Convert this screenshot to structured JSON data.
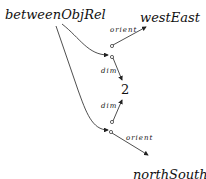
{
  "diagram": {
    "nodes": {
      "source": "betweenObjRel",
      "target_top": "westEast",
      "target_mid": "2",
      "target_bottom": "northSouth"
    },
    "edge_labels": {
      "top_orient": "orient",
      "top_dim": "dim",
      "bottom_dim": "dim",
      "bottom_orient": "orient"
    },
    "colors": {
      "line": "#222222",
      "text": "#111111"
    }
  }
}
